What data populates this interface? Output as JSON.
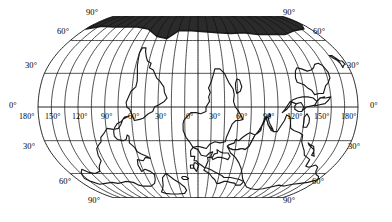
{
  "map": {
    "title": "World map in Robinson pseudocylindrical projection",
    "projection": "robinson",
    "graticule_interval_deg": 30,
    "degree_symbol": "°",
    "colors": {
      "ocean": "#ffffff",
      "land_fill": "#ffffff",
      "coastline": "#1a1a1a",
      "graticule": "#111111",
      "label": "#000000",
      "antarctica_fill": "#2b2b2b"
    },
    "latitude_labels_left": [
      {
        "text": "90°",
        "x": 86,
        "y": 8
      },
      {
        "text": "60°",
        "x": 57,
        "y": 27
      },
      {
        "text": "30°",
        "x": 25,
        "y": 61
      },
      {
        "text": "0°",
        "x": 9,
        "y": 101
      },
      {
        "text": "30°",
        "x": 23,
        "y": 142
      },
      {
        "text": "60°",
        "x": 59,
        "y": 177
      },
      {
        "text": "90°",
        "x": 88,
        "y": 196
      }
    ],
    "latitude_labels_right": [
      {
        "text": "90°",
        "x": 283,
        "y": 8
      },
      {
        "text": "60°",
        "x": 313,
        "y": 27
      },
      {
        "text": "30°",
        "x": 347,
        "y": 61
      },
      {
        "text": "0°",
        "x": 370,
        "y": 101
      },
      {
        "text": "30°",
        "x": 348,
        "y": 142
      },
      {
        "text": "60°",
        "x": 312,
        "y": 177
      },
      {
        "text": "90°",
        "x": 283,
        "y": 196
      }
    ],
    "longitude_labels": [
      {
        "text": "180°",
        "x": 19,
        "y": 113
      },
      {
        "text": "150°",
        "x": 45,
        "y": 113
      },
      {
        "text": "120°",
        "x": 72,
        "y": 113
      },
      {
        "text": "90°",
        "x": 101,
        "y": 113
      },
      {
        "text": "60°",
        "x": 128,
        "y": 113
      },
      {
        "text": "30°",
        "x": 155,
        "y": 113
      },
      {
        "text": "0°",
        "x": 186,
        "y": 113
      },
      {
        "text": "30°",
        "x": 209,
        "y": 113
      },
      {
        "text": "60°",
        "x": 236,
        "y": 113
      },
      {
        "text": "90°",
        "x": 263,
        "y": 113
      },
      {
        "text": "120°",
        "x": 287,
        "y": 113
      },
      {
        "text": "150°",
        "x": 314,
        "y": 113
      },
      {
        "text": "180°",
        "x": 341,
        "y": 113
      }
    ],
    "latitude_values_deg": [
      90,
      60,
      30,
      0,
      -30,
      -60,
      -90
    ],
    "longitude_values_deg": [
      -180,
      -150,
      -120,
      -90,
      -60,
      -30,
      0,
      30,
      60,
      90,
      120,
      150,
      180
    ],
    "continents": [
      "North America",
      "South America",
      "Europe",
      "Africa",
      "Asia",
      "Australia",
      "Antarctica",
      "Greenland"
    ]
  }
}
